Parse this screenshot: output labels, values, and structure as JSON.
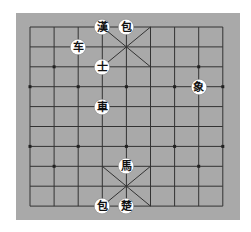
{
  "board": {
    "background": "#a9a9a9",
    "line_color": "#333333",
    "grid": {
      "left": 30,
      "top": 27,
      "col_step": 24.1,
      "row_step": 19.9,
      "cols": 9,
      "rows": 10
    }
  },
  "pieces": [
    {
      "char": "漢",
      "col": 3,
      "row": 0,
      "side": "top",
      "name": "general"
    },
    {
      "char": "包",
      "col": 4,
      "row": 0,
      "side": "top",
      "name": "cannon"
    },
    {
      "char": "车",
      "col": 2,
      "row": 1,
      "side": "top",
      "name": "chariot"
    },
    {
      "char": "士",
      "col": 3,
      "row": 2,
      "side": "top",
      "name": "advisor"
    },
    {
      "char": "象",
      "col": 7,
      "row": 3,
      "side": "top",
      "name": "elephant"
    },
    {
      "char": "車",
      "col": 3,
      "row": 4,
      "side": "bottom",
      "name": "chariot"
    },
    {
      "char": "馬",
      "col": 4,
      "row": 7,
      "side": "bottom",
      "name": "horse"
    },
    {
      "char": "包",
      "col": 3,
      "row": 9,
      "side": "bottom",
      "name": "cannon"
    },
    {
      "char": "楚",
      "col": 4,
      "row": 9,
      "side": "bottom",
      "name": "general"
    }
  ]
}
